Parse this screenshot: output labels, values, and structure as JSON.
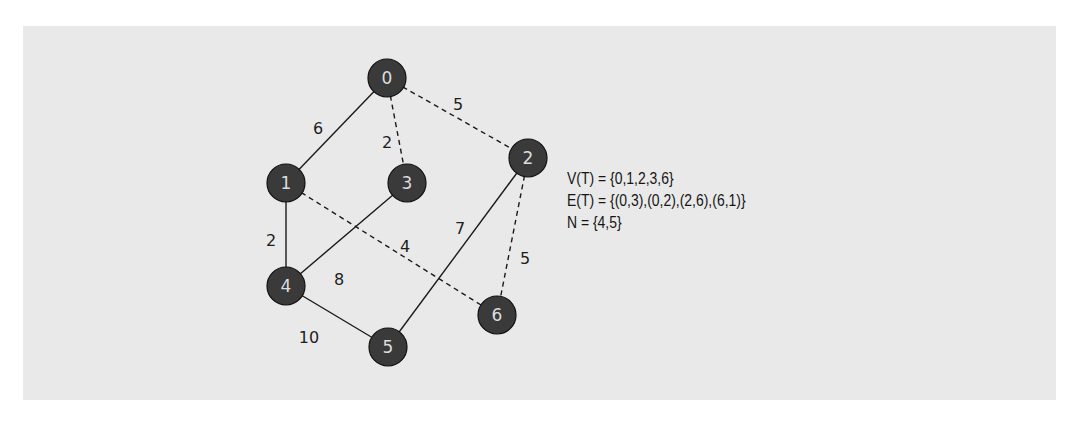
{
  "diagram": {
    "type": "weighted-graph",
    "nodes": [
      {
        "id": "0",
        "x": 387,
        "y": 78
      },
      {
        "id": "1",
        "x": 286,
        "y": 183
      },
      {
        "id": "2",
        "x": 528,
        "y": 158
      },
      {
        "id": "3",
        "x": 407,
        "y": 183
      },
      {
        "id": "4",
        "x": 286,
        "y": 286
      },
      {
        "id": "5",
        "x": 388,
        "y": 347
      },
      {
        "id": "6",
        "x": 497,
        "y": 315
      }
    ],
    "edges": [
      {
        "from": "0",
        "to": "1",
        "weight": "6",
        "style": "solid",
        "label_x": 318,
        "label_y": 134
      },
      {
        "from": "0",
        "to": "3",
        "weight": "2",
        "style": "dashed",
        "label_x": 387,
        "label_y": 148
      },
      {
        "from": "0",
        "to": "2",
        "weight": "5",
        "style": "dashed",
        "label_x": 458,
        "label_y": 110
      },
      {
        "from": "1",
        "to": "4",
        "weight": "2",
        "style": "solid",
        "label_x": 271,
        "label_y": 246
      },
      {
        "from": "3",
        "to": "4",
        "weight": "8",
        "style": "solid",
        "label_x": 339,
        "label_y": 285
      },
      {
        "from": "1",
        "to": "6",
        "weight": "4",
        "style": "dashed",
        "label_x": 405,
        "label_y": 252
      },
      {
        "from": "2",
        "to": "5",
        "weight": "7",
        "style": "solid",
        "label_x": 460,
        "label_y": 234
      },
      {
        "from": "2",
        "to": "6",
        "weight": "5",
        "style": "dashed",
        "label_x": 525,
        "label_y": 264
      },
      {
        "from": "4",
        "to": "5",
        "weight": "10",
        "style": "solid",
        "label_x": 309,
        "label_y": 343
      }
    ],
    "info": {
      "vertices": "V(T) = {0,1,2,3,6}",
      "edges": "E(T) = {(0,3),(0,2),(2,6),(6,1)}",
      "next": "N = {4,5}"
    },
    "colors": {
      "background": "#e9e9e9",
      "node_fill": "#3a3a3a",
      "node_text": "#dddddd",
      "edge": "#1a1a1a"
    }
  }
}
